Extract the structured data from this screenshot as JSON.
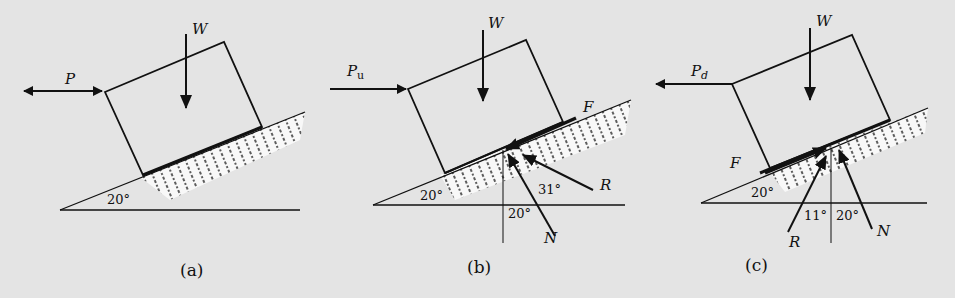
{
  "figure": {
    "panels": [
      {
        "id": "a",
        "caption": "(a)",
        "incline_angle": "20°",
        "forces": {
          "push": "P",
          "weight": "W"
        }
      },
      {
        "id": "b",
        "caption": "(b)",
        "incline_angle": "20°",
        "forces": {
          "push": "P",
          "push_sub": "u",
          "weight": "W",
          "friction": "F",
          "resultant": "R",
          "normal": "N"
        },
        "angles": {
          "friction_angle": "31°",
          "normal_angle": "20°"
        }
      },
      {
        "id": "c",
        "caption": "(c)",
        "incline_angle": "20°",
        "forces": {
          "push": "P",
          "push_sub": "d",
          "weight": "W",
          "friction": "F",
          "resultant": "R",
          "normal": "N"
        },
        "angles": {
          "friction_angle": "11°",
          "normal_angle": "20°"
        }
      }
    ],
    "colors": {
      "background": "#e4e4e4",
      "ink": "#111111",
      "ground": "#ffffff"
    }
  }
}
